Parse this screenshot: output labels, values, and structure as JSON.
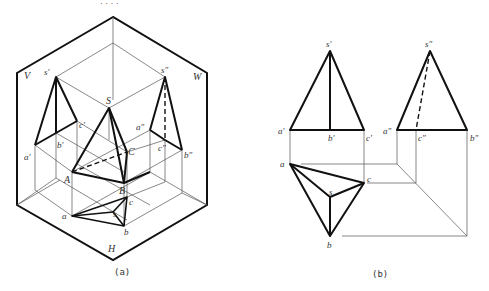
{
  "figure": {
    "top_marks": "·  ·  ·  ·",
    "panel_a": {
      "caption": "(a)",
      "plane_labels": {
        "V": "V",
        "W": "W",
        "H": "H"
      },
      "point_labels": {
        "s1": "s′",
        "a1": "a′",
        "b1": "b′",
        "c1": "c′",
        "s2": "s″",
        "a2": "a″",
        "b2": "b″",
        "c2": "c″",
        "S": "S",
        "A": "A",
        "B": "B",
        "C": "C",
        "s": "s",
        "a": "a",
        "b": "b",
        "c": "c"
      }
    },
    "panel_b": {
      "caption": "(b)",
      "point_labels": {
        "s1": "s′",
        "a1": "a′",
        "b1": "b′",
        "c1": "c′",
        "s2": "s″",
        "a2": "a″",
        "b2": "b″",
        "c2": "c″",
        "s": "s",
        "a": "a",
        "b": "b",
        "c": "c"
      }
    }
  }
}
